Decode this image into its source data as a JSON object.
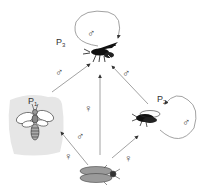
{
  "diagram": {
    "type": "parasitoid host-parasite cycle",
    "nodes": {
      "host": {
        "label": "",
        "description": "host moth (grey)"
      },
      "p1": {
        "label": "P",
        "subscript": "1",
        "description": "parasitoid 1 (bee-like, shaded box)"
      },
      "p2": {
        "label": "P",
        "subscript": "2",
        "description": "parasitoid 2 (black fly-like)"
      },
      "p3": {
        "label": "P",
        "subscript": "3",
        "description": "parasitoid 3 (wasp)"
      }
    },
    "edges": [
      {
        "from": "host",
        "to": "p1",
        "symbol": "♀"
      },
      {
        "from": "host",
        "to": "p3",
        "symbol": "♀"
      },
      {
        "from": "host",
        "to": "p2",
        "symbol": "♀"
      },
      {
        "from": "p1",
        "to": "p3",
        "symbol": "♂"
      },
      {
        "from": "p2",
        "to": "p3",
        "symbol": "♂"
      },
      {
        "from": "p1",
        "to": "p1",
        "symbol": "♂",
        "note": "host moth to P1 male label near arrow"
      },
      {
        "from": "p3",
        "to": "p3",
        "symbol": "♂",
        "loop": true
      },
      {
        "from": "p2",
        "to": "p2",
        "symbol": "♂",
        "loop": true
      }
    ],
    "symbols": {
      "female": "♀",
      "male": "♂"
    },
    "colors": {
      "p1_box": "#e6e6e6",
      "host_fill": "#9a9a9a",
      "insect_dark": "#111111",
      "line": "#8a8a8a"
    }
  }
}
